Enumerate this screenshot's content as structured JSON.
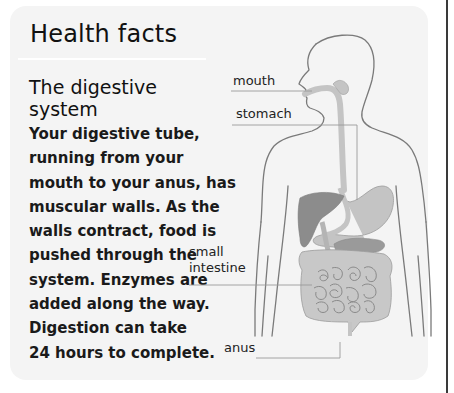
{
  "header": {
    "title": "Health facts"
  },
  "article": {
    "subheading_lines": [
      "The digestive",
      "system"
    ],
    "body_lines": [
      "Your digestive tube,",
      "running from your",
      "mouth to your anus, has",
      "muscular walls. As the",
      "walls contract, food is",
      "pushed through the",
      "system. Enzymes are",
      "added along the way.",
      "Digestion can take",
      "24 hours to complete."
    ]
  },
  "diagram": {
    "labels": {
      "mouth": "mouth",
      "stomach": "stomach",
      "small_intestine_line1": "small",
      "small_intestine_line2": "intestine",
      "anus": "anus"
    },
    "colors": {
      "card_background": "#f4f4f4",
      "outline": "#7a7a7a",
      "tube": "#c4c4c4",
      "liver": "#8c8c8c",
      "pancreas": "#9a9a9a",
      "intestine": "#c8c8c8",
      "leader_line": "#9a9a9a"
    }
  }
}
